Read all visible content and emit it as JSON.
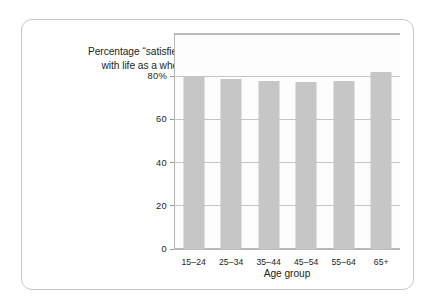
{
  "chart_data": {
    "type": "bar",
    "title": "Percentage “satisfied” with life as a whole",
    "title_lines": [
      "Percentage “satisfied”",
      "with life as a whole"
    ],
    "xlabel": "Age group",
    "ylabel": "",
    "categories": [
      "15–24",
      "25–34",
      "35–44",
      "45–54",
      "55–64",
      "65+"
    ],
    "values": [
      80,
      78.5,
      78,
      77.5,
      78,
      82
    ],
    "ylim": [
      0,
      100
    ],
    "yticks": [
      0,
      20,
      40,
      60,
      80
    ],
    "ytick_labels": [
      "0",
      "20",
      "40",
      "60",
      "80%"
    ],
    "grid": "horizontal",
    "legend": "none",
    "bar_color": "#c6c6c6",
    "gridline_color": "#c5c5c5",
    "axis_color": "#b9b9b9",
    "text_color": "#231f20",
    "panel_border_color": "#c9c9c9",
    "background": "#ffffff"
  }
}
